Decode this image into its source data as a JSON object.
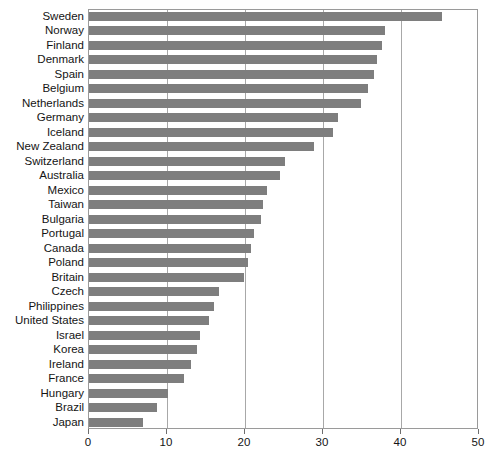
{
  "chart_data": {
    "type": "bar",
    "orientation": "horizontal",
    "title": "",
    "subtitle": "",
    "xlabel": "",
    "ylabel": "",
    "xlim": [
      0,
      50
    ],
    "xticks": [
      0,
      10,
      20,
      30,
      40,
      50
    ],
    "gridlines": [
      10,
      20,
      30,
      40
    ],
    "grid": true,
    "legend": null,
    "bar_color": "#7e7e7e",
    "axis_color": "#9a9a9a",
    "categories": [
      "Sweden",
      "Norway",
      "Finland",
      "Denmark",
      "Spain",
      "Belgium",
      "Netherlands",
      "Germany",
      "Iceland",
      "New Zealand",
      "Switzerland",
      "Australia",
      "Mexico",
      "Taiwan",
      "Bulgaria",
      "Portugal",
      "Canada",
      "Poland",
      "Britain",
      "Czech",
      "Philippines",
      "United States",
      "Israel",
      "Korea",
      "Ireland",
      "France",
      "Hungary",
      "Brazil",
      "Japan"
    ],
    "values": [
      45.3,
      37.9,
      37.6,
      36.9,
      36.5,
      35.8,
      34.9,
      31.9,
      31.3,
      28.9,
      25.1,
      24.5,
      22.8,
      22.3,
      22.1,
      21.2,
      20.8,
      20.4,
      19.9,
      16.6,
      16.0,
      15.4,
      14.2,
      13.8,
      13.1,
      12.2,
      10.1,
      8.7,
      6.9
    ]
  }
}
